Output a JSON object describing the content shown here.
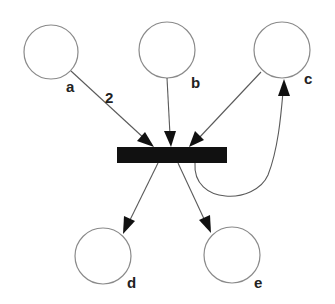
{
  "diagram": {
    "type": "petri-net",
    "places": [
      {
        "id": "a",
        "label": "a",
        "tokens": 0
      },
      {
        "id": "b",
        "label": "b",
        "tokens": 0
      },
      {
        "id": "c",
        "label": "c",
        "tokens": 0
      },
      {
        "id": "d",
        "label": "d",
        "tokens": 0
      },
      {
        "id": "e",
        "label": "e",
        "tokens": 0
      }
    ],
    "transitions": [
      {
        "id": "t1",
        "label": ""
      }
    ],
    "arcs": [
      {
        "id": "a-t1",
        "from": "a",
        "to": "t1",
        "weight": "2"
      },
      {
        "id": "b-t1",
        "from": "b",
        "to": "t1",
        "weight": ""
      },
      {
        "id": "c-t1",
        "from": "c",
        "to": "t1",
        "weight": ""
      },
      {
        "id": "t1-c",
        "from": "t1",
        "to": "c",
        "weight": ""
      },
      {
        "id": "t1-d",
        "from": "t1",
        "to": "d",
        "weight": ""
      },
      {
        "id": "t1-e",
        "from": "t1",
        "to": "e",
        "weight": ""
      }
    ],
    "colors": {
      "transition": "#111111",
      "place_stroke": "#8a8a8a",
      "arc": "#5a5a5a"
    }
  }
}
